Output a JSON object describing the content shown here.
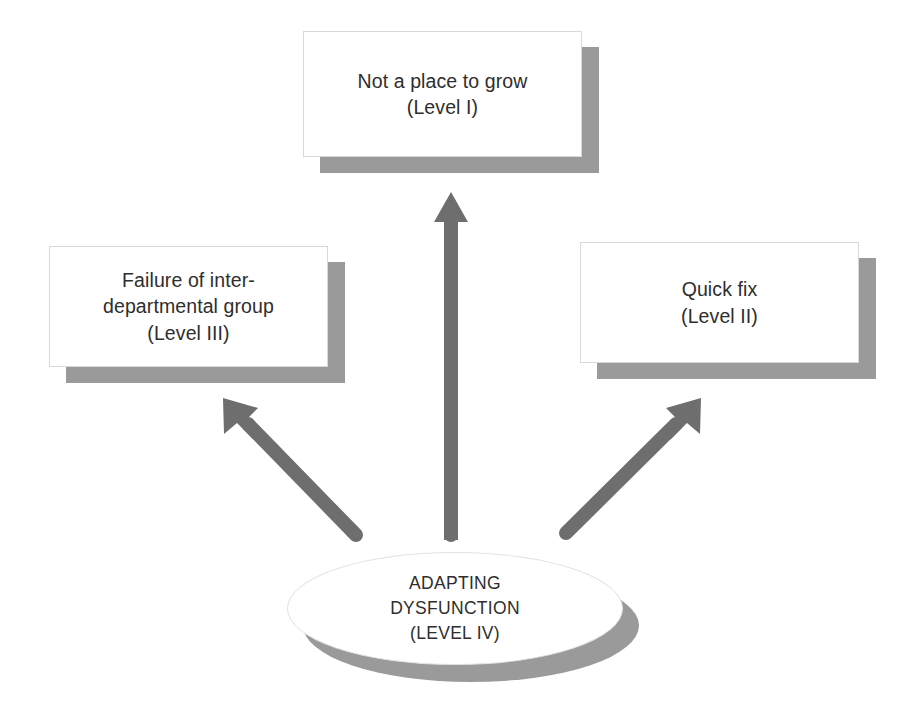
{
  "diagram": {
    "background_color": "#ffffff",
    "shape_fill_color": "#ffffff",
    "shape_shadow_color": "#9a9a9a",
    "shape_border_color": "#d8d8d8",
    "arrow_color": "#6e6e6e",
    "text_color": "#2e2e2e",
    "nodes": [
      {
        "id": "level-1",
        "shape": "rectangle",
        "label": "Not a place to grow\n(Level I)",
        "line1": "Not a place to grow",
        "line2": "(Level I)",
        "level": "Level I"
      },
      {
        "id": "level-3",
        "shape": "rectangle",
        "label": "Failure of inter-\ndepartmental group\n(Level III)",
        "line1": "Failure of inter-",
        "line2": "departmental group",
        "line3": "(Level III)",
        "level": "Level III"
      },
      {
        "id": "level-2",
        "shape": "rectangle",
        "label": "Quick fix\n(Level II)",
        "line1": "Quick fix",
        "line2": "(Level II)",
        "level": "Level II"
      },
      {
        "id": "level-4",
        "shape": "ellipse",
        "label": "ADAPTING\nDYSFUNCTION\n(LEVEL IV)",
        "line1": "ADAPTING",
        "line2": "DYSFUNCTION",
        "line3": "(LEVEL IV)",
        "level": "LEVEL IV"
      }
    ],
    "arrows": [
      {
        "id": "arrow-root-to-level-1",
        "from": "level-4",
        "to": "level-1",
        "direction": "up"
      },
      {
        "id": "arrow-root-to-level-3",
        "from": "level-4",
        "to": "level-3",
        "direction": "up-left"
      },
      {
        "id": "arrow-root-to-level-2",
        "from": "level-4",
        "to": "level-2",
        "direction": "up-right"
      }
    ]
  }
}
